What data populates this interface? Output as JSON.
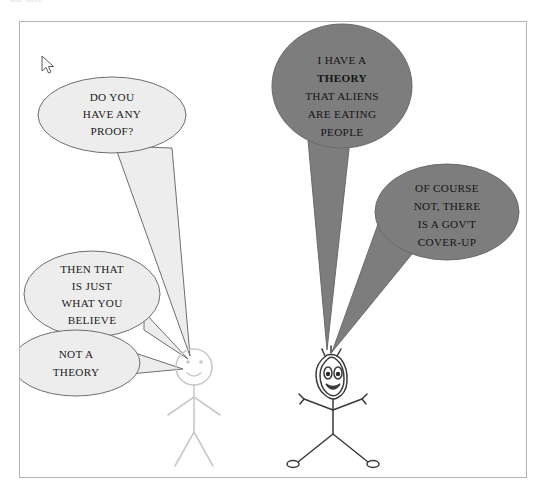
{
  "page": {
    "clipped_caption": "not sure",
    "background_color": "#ffffff",
    "frame_border_color": "#b4b4b4"
  },
  "cursor": {
    "name": "arrow-pointer",
    "x": 21,
    "y": 33
  },
  "colors": {
    "light_bubble_fill": "#ededed",
    "light_bubble_stroke": "#6e6e6e",
    "dark_bubble_fill": "#7d7d7d",
    "dark_bubble_stroke": "#6a6a6a",
    "light_figure_stroke": "#c9c9c9",
    "dark_figure_stroke": "#3a3a3a",
    "text_dark": "#141414"
  },
  "characters": [
    {
      "id": "calm-stick-figure",
      "label": "calm stick figure",
      "side": "left",
      "expression": "smiling",
      "stroke": "#c9c9c9"
    },
    {
      "id": "excited-stick-figure",
      "label": "excited stick figure",
      "side": "right",
      "expression": "wild-eyed",
      "stroke": "#3a3a3a"
    }
  ],
  "bubbles": [
    {
      "id": "bubble-do-you-have-any-proof",
      "style": "light",
      "speaker": "calm-stick-figure",
      "order": 2,
      "lines": [
        {
          "text": "DO YOU",
          "bold": false
        },
        {
          "text": "HAVE ANY",
          "bold": false
        },
        {
          "text": "PROOF?",
          "bold": false
        }
      ]
    },
    {
      "id": "bubble-then-that-is-just-what-you-believe",
      "style": "light",
      "speaker": "calm-stick-figure",
      "order": 4,
      "lines": [
        {
          "text": "THEN THAT",
          "bold": false
        },
        {
          "text": "IS JUST",
          "bold": false
        },
        {
          "text": "WHAT YOU",
          "bold": false
        },
        {
          "text": "BELIEVE",
          "bold": false
        }
      ]
    },
    {
      "id": "bubble-not-a-theory",
      "style": "light",
      "speaker": "calm-stick-figure",
      "order": 5,
      "lines": [
        {
          "text": "NOT A",
          "bold": false
        },
        {
          "text": "THEORY",
          "bold": false
        }
      ]
    },
    {
      "id": "bubble-i-have-a-theory",
      "style": "dark",
      "speaker": "excited-stick-figure",
      "order": 1,
      "lines": [
        {
          "text": "I HAVE A",
          "bold": false
        },
        {
          "text": "THEORY",
          "bold": true
        },
        {
          "text": "THAT ALIENS",
          "bold": false
        },
        {
          "text": "ARE EATING",
          "bold": false
        },
        {
          "text": "PEOPLE",
          "bold": false
        }
      ]
    },
    {
      "id": "bubble-of-course-not",
      "style": "dark",
      "speaker": "excited-stick-figure",
      "order": 3,
      "lines": [
        {
          "text": "OF COURSE",
          "bold": false
        },
        {
          "text": "NOT, THERE",
          "bold": false
        },
        {
          "text": "IS A GOV'T",
          "bold": false
        },
        {
          "text": "COVER-UP",
          "bold": false
        }
      ]
    }
  ]
}
